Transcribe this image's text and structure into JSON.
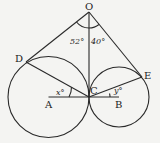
{
  "diagram": {
    "type": "geometry",
    "points": {
      "O": {
        "label": "O"
      },
      "D": {
        "label": "D"
      },
      "E": {
        "label": "E"
      },
      "A": {
        "label": "A"
      },
      "B": {
        "label": "B"
      },
      "C": {
        "label": "C"
      }
    },
    "angles": {
      "DOC": "52°",
      "COE": "40°",
      "DCA_x": "x°",
      "ECB_y": "y°"
    },
    "circles": [
      {
        "name": "circle-A",
        "center": "A"
      },
      {
        "name": "circle-B",
        "center": "B"
      }
    ]
  }
}
